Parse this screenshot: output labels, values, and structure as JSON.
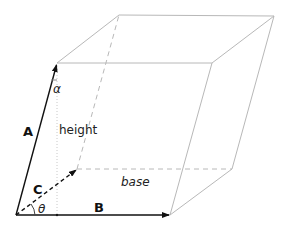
{
  "diagram": {
    "labels": {
      "a": "A",
      "b": "B",
      "c": "C",
      "alpha": "α",
      "theta": "θ",
      "height": "height",
      "base": "base"
    },
    "vertices": {
      "origin": [
        16,
        215
      ],
      "A": [
        57,
        63
      ],
      "B": [
        170,
        215
      ],
      "C": [
        77,
        169
      ],
      "A_plus_B": [
        212,
        63
      ],
      "A_plus_C": [
        119,
        15
      ],
      "B_plus_C": [
        232,
        169
      ],
      "A_plus_B_plus_C": [
        274,
        16
      ],
      "height_foot": [
        57,
        215
      ]
    },
    "colors": {
      "vector": "#111111",
      "edge": "#b8b8b8",
      "dashed": "#b8b8b8",
      "label": "#111111"
    }
  }
}
